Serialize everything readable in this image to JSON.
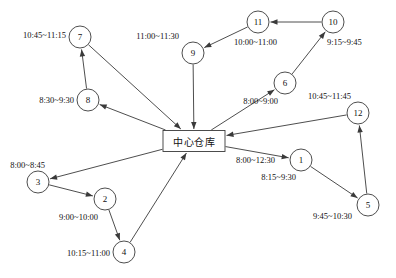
{
  "diagram": {
    "type": "directed-graph",
    "title": "",
    "hub": {
      "id": "hub",
      "label": "中心仓库",
      "time_window": "8:00~12:30",
      "shape": "rectangle",
      "x": 194,
      "y": 141,
      "w": 62,
      "h": 21,
      "label_x": 194,
      "label_y": 141,
      "time_x": 236,
      "time_y": 160,
      "time_align": "l"
    },
    "stroke_color": "#3a3a3a",
    "fill_color": "#ffffff",
    "nodes": [
      {
        "id": "1",
        "label": "1",
        "x": 301,
        "y": 160,
        "r": 11,
        "time_window": "8:15~9:30",
        "time_x": 296,
        "time_y": 177,
        "time_align": "r"
      },
      {
        "id": "2",
        "label": "2",
        "x": 105,
        "y": 199,
        "r": 11,
        "time_window": "9:00~10:00",
        "time_x": 98,
        "time_y": 217,
        "time_align": "r"
      },
      {
        "id": "3",
        "label": "3",
        "x": 38,
        "y": 182,
        "r": 11,
        "time_window": "8:00~8:45",
        "time_x": 45,
        "time_y": 165,
        "time_align": "r"
      },
      {
        "id": "4",
        "label": "4",
        "x": 124,
        "y": 252,
        "r": 11,
        "time_window": "10:15~11:00",
        "time_x": 110,
        "time_y": 253,
        "time_align": "r"
      },
      {
        "id": "5",
        "label": "5",
        "x": 368,
        "y": 205,
        "r": 11,
        "time_window": "9:45~10:30",
        "time_x": 352,
        "time_y": 216,
        "time_align": "r"
      },
      {
        "id": "6",
        "label": "6",
        "x": 285,
        "y": 83,
        "r": 11,
        "time_window": "8:00~9:00",
        "time_x": 278,
        "time_y": 101,
        "time_align": "r"
      },
      {
        "id": "7",
        "label": "7",
        "x": 80,
        "y": 37,
        "r": 11,
        "time_window": "10:45~11:15",
        "time_x": 66,
        "time_y": 35,
        "time_align": "r"
      },
      {
        "id": "8",
        "label": "8",
        "x": 88,
        "y": 100,
        "r": 11,
        "time_window": "8:30~9:30",
        "time_x": 74,
        "time_y": 100,
        "time_align": "r"
      },
      {
        "id": "9",
        "label": "9",
        "x": 193,
        "y": 53,
        "r": 11,
        "time_window": "11:00~11:30",
        "time_x": 179,
        "time_y": 36,
        "time_align": "r"
      },
      {
        "id": "10",
        "label": "10",
        "x": 333,
        "y": 22,
        "r": 11,
        "time_window": "9:15~9:45",
        "time_x": 327,
        "time_y": 42,
        "time_align": "l"
      },
      {
        "id": "11",
        "label": "11",
        "x": 258,
        "y": 22,
        "r": 11,
        "time_window": "10:00~11:00",
        "time_x": 234,
        "time_y": 42,
        "time_align": "l"
      },
      {
        "id": "12",
        "label": "12",
        "x": 358,
        "y": 113,
        "r": 11,
        "time_window": "10:45~11:45",
        "time_x": 351,
        "time_y": 96,
        "time_align": "r"
      }
    ],
    "edges": [
      {
        "from": "8",
        "to": "7",
        "arrow": "to"
      },
      {
        "from": "7",
        "to": "hub",
        "arrow": "to"
      },
      {
        "from": "hub",
        "to": "8",
        "arrow": "to"
      },
      {
        "from": "9",
        "to": "hub",
        "arrow": "to"
      },
      {
        "from": "11",
        "to": "9",
        "arrow": "to"
      },
      {
        "from": "10",
        "to": "11",
        "arrow": "to"
      },
      {
        "from": "6",
        "to": "10",
        "arrow": "to"
      },
      {
        "from": "hub",
        "to": "6",
        "arrow": "to"
      },
      {
        "from": "12",
        "to": "hub",
        "arrow": "to"
      },
      {
        "from": "hub",
        "to": "1",
        "arrow": "to"
      },
      {
        "from": "1",
        "to": "5",
        "arrow": "to"
      },
      {
        "from": "5",
        "to": "12",
        "arrow": "to"
      },
      {
        "from": "hub",
        "to": "3",
        "arrow": "to"
      },
      {
        "from": "3",
        "to": "2",
        "arrow": "to"
      },
      {
        "from": "2",
        "to": "4",
        "arrow": "to"
      },
      {
        "from": "4",
        "to": "hub",
        "arrow": "to"
      }
    ]
  }
}
